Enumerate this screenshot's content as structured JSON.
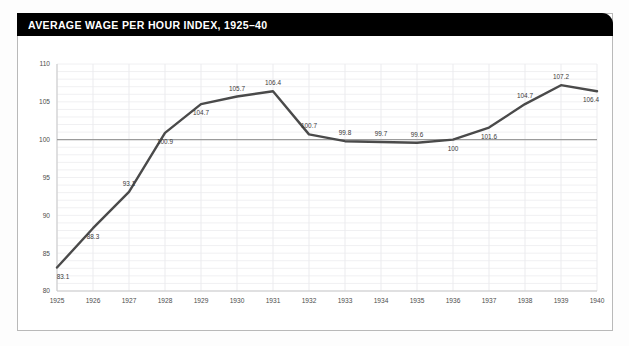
{
  "card": {
    "title": "AVERAGE WAGE PER HOUR INDEX, 1925–40"
  },
  "chart_data": {
    "type": "line",
    "title": "AVERAGE WAGE PER HOUR INDEX, 1925–40",
    "xlabel": "",
    "ylabel": "",
    "categories": [
      "1925",
      "1926",
      "1927",
      "1928",
      "1929",
      "1930",
      "1931",
      "1932",
      "1933",
      "1934",
      "1935",
      "1936",
      "1937",
      "1938",
      "1939",
      "1940"
    ],
    "values": [
      83.1,
      88.3,
      93.1,
      100.9,
      104.7,
      105.7,
      106.4,
      100.7,
      99.8,
      99.7,
      99.6,
      100,
      101.6,
      104.7,
      107.2,
      106.4
    ],
    "point_labels": [
      "83.1",
      "88.3",
      "93.1",
      "100.9",
      "104.7",
      "105.7",
      "106.4",
      "100.7",
      "99.8",
      "99.7",
      "99.6",
      "100",
      "101.6",
      "104.7",
      "107.2",
      "106.4"
    ],
    "label_positions": [
      "below",
      "below",
      "above",
      "below",
      "below",
      "above",
      "above",
      "above",
      "above",
      "above",
      "above",
      "below",
      "below",
      "above",
      "above",
      "below"
    ],
    "ylim": [
      80,
      110
    ],
    "yticks": [
      80,
      85,
      90,
      95,
      100,
      105,
      110
    ],
    "ytick_labels": [
      "80",
      "85",
      "90",
      "95",
      "100",
      "105",
      "110"
    ],
    "xtick_labels": [
      "1925",
      "1926",
      "1927",
      "1928",
      "1929",
      "1930",
      "1931",
      "1932",
      "1933",
      "1934",
      "1935",
      "1936",
      "1937",
      "1938",
      "1939",
      "1940"
    ],
    "reference_line": 100,
    "grid": true,
    "legend": "none",
    "line_color": "#4a4a4a",
    "reference_line_color": "#9b9b9b",
    "grid_color": "#f0f0f2",
    "title_bar_color": "#000000",
    "title_text_color": "#ffffff"
  }
}
